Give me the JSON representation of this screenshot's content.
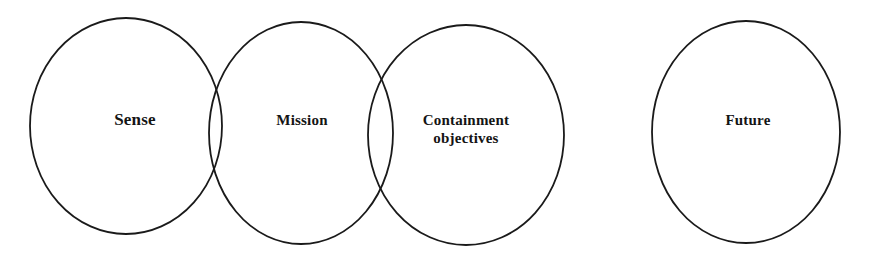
{
  "figure": {
    "type": "venn-chain-diagram",
    "background_color": "#ffffff",
    "outline_color": "#1a1a1a",
    "text_color": "#141414",
    "width": 875,
    "height": 254
  },
  "nodes": [
    {
      "id": "sense",
      "label": "Sense",
      "shape": "ellipse",
      "cx": 126,
      "cy": 126,
      "rx": 96,
      "ry": 108,
      "label_x": 135,
      "label_y": 120,
      "font_size": 17,
      "overlaps_next": true
    },
    {
      "id": "mission",
      "label": "Mission",
      "shape": "ellipse",
      "cx": 301,
      "cy": 133,
      "rx": 92,
      "ry": 111,
      "label_x": 302,
      "label_y": 121,
      "font_size": 15,
      "overlaps_next": true
    },
    {
      "id": "containment-objectives",
      "label": "Containment\nobjectives",
      "shape": "ellipse",
      "cx": 466,
      "cy": 135,
      "rx": 98,
      "ry": 110,
      "label_x": 466,
      "label_y": 130,
      "font_size": 15,
      "overlaps_next": false
    },
    {
      "id": "future",
      "label": "Future",
      "shape": "ellipse",
      "cx": 746,
      "cy": 132,
      "rx": 94,
      "ry": 111,
      "label_x": 748,
      "label_y": 121,
      "font_size": 15,
      "overlaps_next": false
    }
  ]
}
